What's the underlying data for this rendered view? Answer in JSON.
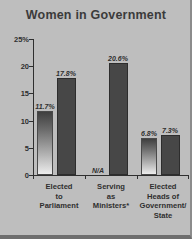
{
  "chart_data": {
    "type": "bar",
    "title": "Women in Government",
    "xlabel": "",
    "ylabel": "",
    "ylim": [
      0,
      25
    ],
    "yticks": [
      "0",
      "5",
      "10",
      "15",
      "20",
      "25%"
    ],
    "grid": false,
    "legend": "none",
    "categories": [
      "Elected to Parliament",
      "Serving as Ministers*",
      "Elected Heads of Government/ State"
    ],
    "series": [
      {
        "name": "series-1",
        "style": "gradient",
        "values": [
          11.7,
          null,
          6.8
        ],
        "labels": [
          "11.7%",
          "N/A",
          "6.8%"
        ]
      },
      {
        "name": "series-2",
        "style": "solid",
        "values": [
          17.8,
          20.6,
          7.3
        ],
        "labels": [
          "17.8%",
          "20.6%",
          "7.3%"
        ]
      }
    ]
  },
  "colors": {
    "background": "#bebebe",
    "axis": "#2f2f2f",
    "bar_solid": "#474747",
    "bar_gradient_top": "#3f3f3f",
    "bar_gradient_bottom": "#ededed",
    "text": "#2e2e2e"
  },
  "axis": {
    "tick_0": "0",
    "tick_1": "5",
    "tick_2": "10",
    "tick_3": "15",
    "tick_4": "20",
    "tick_5": "25%"
  },
  "labels": {
    "cat_0": "Elected<br>to<br>Parliament",
    "cat_1": "Serving<br>as<br>Ministers*",
    "cat_2": "Elected<br>Heads of<br>Government/<br>State",
    "v0a": "11.7%",
    "v0b": "17.8%",
    "v1a": "N/A",
    "v1b": "20.6%",
    "v2a": "6.8%",
    "v2b": "7.3%"
  },
  "title": "Women in Government"
}
